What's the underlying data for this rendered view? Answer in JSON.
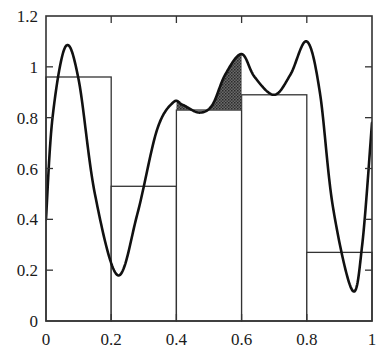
{
  "chart_data": {
    "type": "line",
    "title": "",
    "xlabel": "",
    "ylabel": "",
    "xlim": [
      0,
      1
    ],
    "ylim": [
      0,
      1.2
    ],
    "grid": false,
    "legend": null,
    "x_ticks": [
      "0",
      "0.2",
      "0.4",
      "0.6",
      "0.8",
      "1"
    ],
    "y_ticks": [
      "0",
      "0.2",
      "0.4",
      "0.6",
      "0.8",
      "1",
      "1.2"
    ],
    "series": [
      {
        "name": "function",
        "kind": "curve",
        "x": [
          0,
          0.02,
          0.06,
          0.1,
          0.15,
          0.22,
          0.28,
          0.34,
          0.39,
          0.42,
          0.47,
          0.51,
          0.55,
          0.6,
          0.64,
          0.7,
          0.75,
          0.8,
          0.84,
          0.88,
          0.94,
          0.97,
          1.0
        ],
        "y": [
          0.4,
          0.8,
          1.08,
          0.95,
          0.5,
          0.18,
          0.42,
          0.75,
          0.86,
          0.85,
          0.82,
          0.85,
          0.97,
          1.05,
          0.96,
          0.89,
          0.97,
          1.1,
          0.9,
          0.45,
          0.12,
          0.3,
          0.78
        ]
      },
      {
        "name": "step approximation",
        "kind": "bars",
        "categories": [
          "0-0.2",
          "0.2-0.4",
          "0.4-0.6",
          "0.6-0.8",
          "0.8-1"
        ],
        "x_edges": [
          0,
          0.2,
          0.4,
          0.6,
          0.8,
          1.0
        ],
        "values": [
          0.96,
          0.53,
          0.83,
          0.89,
          0.27
        ]
      }
    ],
    "annotations": [
      {
        "type": "shaded-region",
        "description": "Area between curve and bar top over interval [0.4, 0.6] where curve exceeds bar",
        "x_range": [
          0.4,
          0.6
        ],
        "lower": 0.83
      }
    ]
  },
  "colors": {
    "curve": "#111111",
    "frame": "#333333",
    "shade": "#555555",
    "background": "#ffffff"
  }
}
